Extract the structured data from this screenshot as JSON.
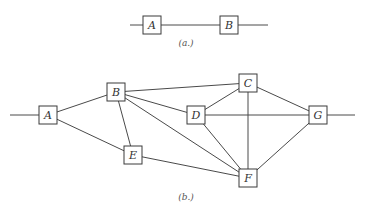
{
  "diagrams": [
    {
      "id": "a",
      "caption": "(a.)",
      "nodes": [
        {
          "id": "A",
          "label": "A"
        },
        {
          "id": "B",
          "label": "B"
        }
      ],
      "edges": [
        [
          "in",
          "A"
        ],
        [
          "A",
          "B"
        ],
        [
          "B",
          "out"
        ]
      ]
    },
    {
      "id": "b",
      "caption": "(b.)",
      "nodes": [
        {
          "id": "A",
          "label": "A"
        },
        {
          "id": "B",
          "label": "B"
        },
        {
          "id": "C",
          "label": "C"
        },
        {
          "id": "D",
          "label": "D"
        },
        {
          "id": "E",
          "label": "E"
        },
        {
          "id": "F",
          "label": "F"
        },
        {
          "id": "G",
          "label": "G"
        }
      ],
      "edges": [
        [
          "in",
          "A"
        ],
        [
          "A",
          "B"
        ],
        [
          "A",
          "E"
        ],
        [
          "B",
          "E"
        ],
        [
          "B",
          "C"
        ],
        [
          "B",
          "D"
        ],
        [
          "B",
          "F"
        ],
        [
          "D",
          "C"
        ],
        [
          "D",
          "G"
        ],
        [
          "D",
          "F"
        ],
        [
          "C",
          "G"
        ],
        [
          "C",
          "F"
        ],
        [
          "E",
          "F"
        ],
        [
          "F",
          "G"
        ],
        [
          "G",
          "out"
        ]
      ]
    }
  ],
  "colors": {
    "line": "#4a4a4a",
    "box_stroke": "#3a3a3a",
    "text": "#333333"
  }
}
